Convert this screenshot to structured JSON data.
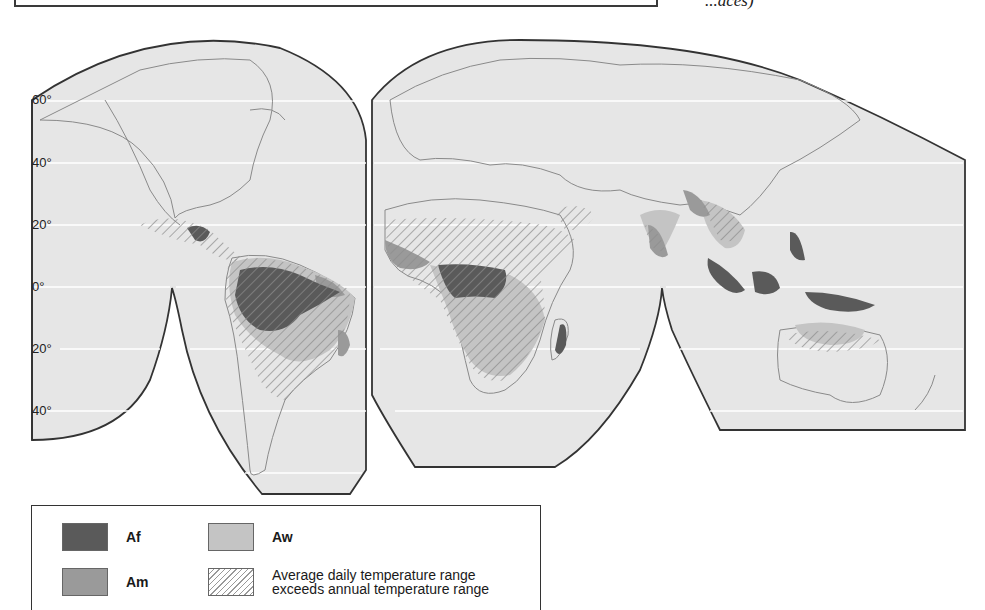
{
  "header": {
    "caption_fragment": "...aces)"
  },
  "map": {
    "type": "interrupted world map (Goode homolosine style)",
    "subject": "Tropical climates (Köppen A group)",
    "latitude_labels": [
      "60°",
      "40°",
      "20°",
      "0°",
      "20°",
      "40°"
    ],
    "colors": {
      "background": "#e6e6e6",
      "Af": "#5a5a5a",
      "Am": "#9a9a9a",
      "Aw": "#c4c4c4",
      "hatch": "#8c8c8c",
      "outline": "#333333",
      "coast": "#8a8a8a"
    }
  },
  "legend": {
    "items": [
      {
        "code": "Af",
        "label": "Af",
        "color": "#5a5a5a"
      },
      {
        "code": "Am",
        "label": "Am",
        "color": "#9a9a9a"
      },
      {
        "code": "Aw",
        "label": "Aw",
        "color": "#c4c4c4"
      },
      {
        "code": "hatch",
        "label_line1": "Average daily temperature range",
        "label_line2": "exceeds annual temperature range"
      }
    ]
  }
}
